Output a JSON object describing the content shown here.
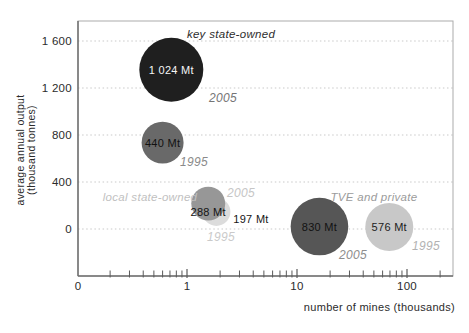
{
  "figure": {
    "width": 469,
    "height": 333,
    "background": "#ffffff"
  },
  "chart_data": {
    "type": "bubble",
    "title": "",
    "x_axis": {
      "label": "number of mines (thousands)",
      "scale": "log",
      "zero_label": "0",
      "tick_values": [
        1,
        10,
        100
      ],
      "tick_labels": [
        "1",
        "10",
        "100"
      ],
      "minor_ticks": [
        0.2,
        0.3,
        0.4,
        0.5,
        0.6,
        0.7,
        0.8,
        0.9,
        2,
        3,
        4,
        5,
        6,
        7,
        8,
        9,
        20,
        30,
        40,
        50,
        60,
        70,
        80,
        90,
        200
      ]
    },
    "y_axis": {
      "label_line1": "average annual output",
      "label_line2": "(thousand tonnes)",
      "ticks": [
        {
          "value": 0,
          "label": "0"
        },
        {
          "value": 400,
          "label": "400"
        },
        {
          "value": 800,
          "label": "800"
        },
        {
          "value": 1200,
          "label": "1 200"
        },
        {
          "value": 1600,
          "label": "1 600"
        }
      ]
    },
    "groups": [
      {
        "name": "key state-owned",
        "name_color": "#2e2e2e",
        "name_px": [
          231,
          34
        ],
        "bubbles": [
          {
            "year": "2005",
            "label": "1 024 Mt",
            "output_mt": 1024,
            "mines_thousands": 0.72,
            "avg_output_thousand_tonnes": 1355,
            "color": "#1f1f1f",
            "label_color": "#f5f5f5",
            "label_inside": true,
            "year_px": [
              223,
              98
            ],
            "year_color": "#757575"
          },
          {
            "year": "1995",
            "label": "440 Mt",
            "output_mt": 440,
            "mines_thousands": 0.6,
            "avg_output_thousand_tonnes": 735,
            "color": "#696969",
            "label_color": "#121212",
            "label_inside": true,
            "year_px": [
              194,
              162
            ],
            "year_color": "#8a8a8a"
          }
        ]
      },
      {
        "name": "local state-owned",
        "name_color": "#c1c1c1",
        "name_px": [
          150,
          197
        ],
        "bubbles": [
          {
            "year": "1995",
            "label": "197 Mt",
            "output_mt": 197,
            "mines_thousands": 1.85,
            "avg_output_thousand_tonnes": 146,
            "color": "#dcdcdc",
            "label_color": "#161616",
            "label_inside": false,
            "label_px": [
              251,
              219
            ],
            "year_px": [
              221,
              237
            ],
            "year_color": "#cacaca"
          },
          {
            "year": "2005",
            "label": "288 Mt",
            "output_mt": 288,
            "mines_thousands": 1.56,
            "avg_output_thousand_tonnes": 216,
            "color": "#979797",
            "label_color": "#121212",
            "label_inside": true,
            "label_dy": 8,
            "year_px": [
              241,
              193
            ],
            "year_color": "#c6c6c6"
          }
        ]
      },
      {
        "name": "TVE and private",
        "name_color": "#9b9b9b",
        "name_px": [
          374,
          197
        ],
        "bubbles": [
          {
            "year": "2005",
            "label": "830 Mt",
            "output_mt": 830,
            "mines_thousands": 16,
            "avg_output_thousand_tonnes": 21,
            "color": "#565656",
            "label_color": "#121212",
            "label_inside": true,
            "year_px": [
              353,
              255
            ],
            "year_color": "#8d8d8d"
          },
          {
            "year": "1995",
            "label": "576 Mt",
            "output_mt": 576,
            "mines_thousands": 69,
            "avg_output_thousand_tonnes": 17,
            "color": "#c8c8c8",
            "label_color": "#1c1c1c",
            "label_inside": true,
            "year_px": [
              426,
              246
            ],
            "year_color": "#b2b2b2"
          }
        ]
      }
    ],
    "layout": {
      "plot": {
        "left": 78,
        "right": 453,
        "top": 21,
        "bottom": 276
      },
      "x_scale": {
        "px_at_1": 187,
        "px_per_decade": 110,
        "zero_px": 78
      },
      "y_scale": {
        "px_at_0": 229,
        "px_per_unit": 0.1175
      },
      "grid_on": true,
      "grid_color": "#c9c9c9",
      "frame_color": "#ababab",
      "axis_color": "#6f6f6f",
      "tick_color": "#5a5a5a",
      "text_color": "#2b2b2b"
    }
  }
}
